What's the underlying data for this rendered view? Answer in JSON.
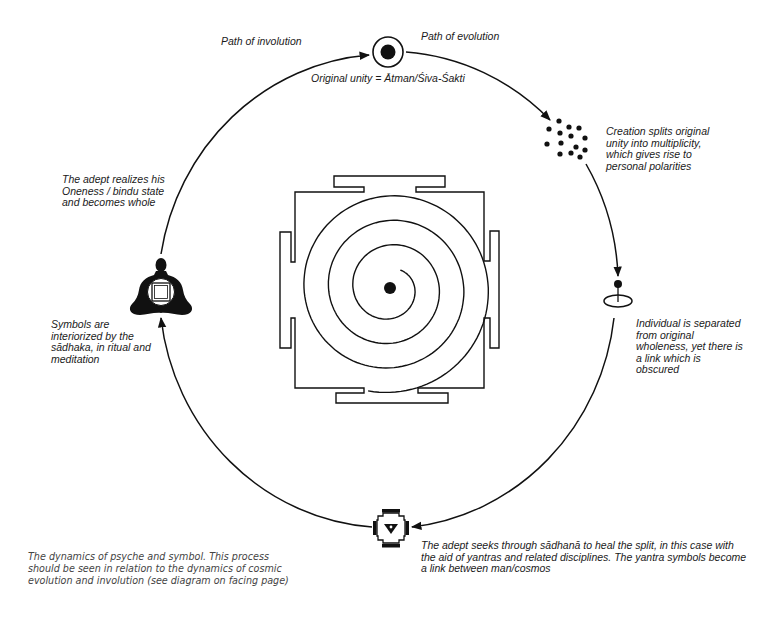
{
  "diagram": {
    "title": "The dynamics of psyche and symbol",
    "colors": {
      "ink": "#111111",
      "background": "#ffffff",
      "caption": "#444444"
    },
    "labels": {
      "path_involution": "Path of involution",
      "path_evolution": "Path of evolution",
      "original_unity": "Original unity = Ātman/Śiva-Śakti",
      "creation": "Creation splits original\nunity into multiplicity,\nwhich gives rise to\npersonal polarities",
      "individual": "Individual is separated\nfrom original\nwholeness, yet there is\na link which is\nobscured",
      "adept_seeks": "The adept seeks through sādhanā to heal the split, in this case with\nthe aid of yantras and related disciplines. The yantra symbols become\na link between man/cosmos",
      "symbols_interiorized": "Symbols are\ninteriorized by the\nsādhaka, in ritual and\nmeditation",
      "adept_realizes": "The adept realizes his\nOneness / bindu state\nand becomes whole"
    },
    "caption": "The dynamics of psyche and symbol. This process\nshould be seen in relation to the dynamics of cosmic\nevolution and involution (see diagram on facing page)",
    "icons": [
      "bindu-circle-icon",
      "multiplicity-dots-icon",
      "individual-ellipse-icon",
      "small-yantra-icon",
      "meditating-figure-icon",
      "spiral-yantra-icon"
    ],
    "cycle": {
      "cx": 389,
      "cy": 290,
      "rx": 229,
      "ry": 238
    },
    "spiral": {
      "cx": 390,
      "cy": 288,
      "r_ref": 37,
      "theta_ref_deg": 540,
      "growth_per_turn": 24.5,
      "start_deg": 300,
      "end_deg": 1544
    }
  }
}
